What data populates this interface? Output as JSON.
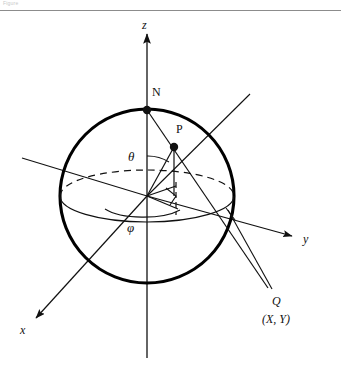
{
  "header": {
    "text": "Figure"
  },
  "figure": {
    "labels": {
      "axis_z": "z",
      "axis_x": "x",
      "axis_y": "y",
      "point_n": "N",
      "point_p": "P",
      "angle_theta": "θ",
      "angle_phi": "φ",
      "point_q": "Q",
      "point_q_coords": "(X, Y)"
    },
    "colors": {
      "ink": "#111111",
      "sphere_outline": "#000000",
      "rule": "#8c8c8c",
      "background": "#ffffff",
      "header_text": "#c9c9c9"
    },
    "geometry": {
      "sphere_center_x": 147,
      "sphere_center_y": 196,
      "sphere_radius": 87,
      "equator_ry": 26,
      "point_n_x": 147,
      "point_n_y": 110,
      "point_p_x": 174,
      "point_p_y": 147,
      "z_axis_top_y": 32,
      "z_axis_bottom_y": 358
    }
  }
}
